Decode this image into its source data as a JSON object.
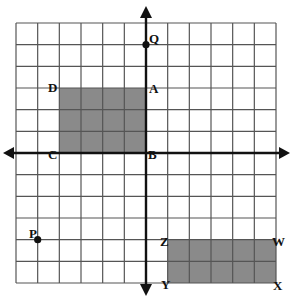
{
  "figure": {
    "type": "coordinate-plane",
    "grid": {
      "columns": 12,
      "rows": 12,
      "x_range": [
        -6,
        6
      ],
      "y_range": [
        -6,
        6
      ],
      "origin_label": "B"
    },
    "colors": {
      "grid_line": "#555555",
      "axis": "#111111",
      "shape_fill": "#8a8a8a",
      "point": "#111111",
      "background": "#ffffff"
    },
    "points": [
      {
        "label": "Q",
        "x": 0,
        "y": 5,
        "dot": true
      },
      {
        "label": "P",
        "x": -5,
        "y": -4,
        "dot": true
      }
    ],
    "shapes": [
      {
        "name": "rectangle-ABCD",
        "vertices": [
          {
            "label": "A",
            "x": 0,
            "y": 3
          },
          {
            "label": "B",
            "x": 0,
            "y": 0
          },
          {
            "label": "C",
            "x": -4,
            "y": 0
          },
          {
            "label": "D",
            "x": -4,
            "y": 3
          }
        ]
      },
      {
        "name": "rectangle-WXYZ",
        "vertices": [
          {
            "label": "W",
            "x": 6,
            "y": -4
          },
          {
            "label": "X",
            "x": 6,
            "y": -6
          },
          {
            "label": "Y",
            "x": 1,
            "y": -6
          },
          {
            "label": "Z",
            "x": 1,
            "y": -4
          }
        ]
      }
    ],
    "labels": {
      "Q": "Q",
      "A": "A",
      "B": "B",
      "C": "C",
      "D": "D",
      "P": "P",
      "W": "W",
      "X": "X",
      "Y": "Y",
      "Z": "Z"
    }
  }
}
